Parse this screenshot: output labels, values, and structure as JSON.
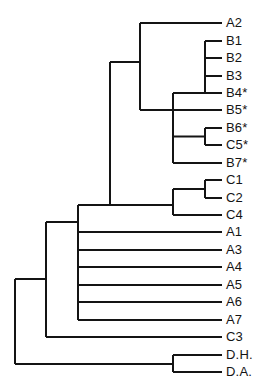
{
  "figure": {
    "kind": "dendrogram",
    "orientation": "horizontal-right-leaves",
    "background_color": "#ffffff",
    "line_color": "#141414",
    "label_color": "#141414",
    "line_width": 2,
    "width": 279,
    "height": 388
  },
  "chart_data": {
    "type": "tree",
    "title": "",
    "xlabel": "",
    "ylabel": "",
    "grid": false,
    "legend": null,
    "leaf_count": 21,
    "leaves": [
      {
        "id": "A2",
        "label": "A2",
        "y": 23,
        "branch_x": 140,
        "starred": false
      },
      {
        "id": "B1",
        "label": "B1",
        "y": 41,
        "branch_x": 205,
        "starred": false
      },
      {
        "id": "B2",
        "label": "B2",
        "y": 58,
        "branch_x": 205,
        "starred": false
      },
      {
        "id": "B3",
        "label": "B3",
        "y": 76,
        "branch_x": 205,
        "starred": false
      },
      {
        "id": "B4",
        "label": "B4*",
        "y": 93,
        "branch_x": 205,
        "starred": true
      },
      {
        "id": "B5",
        "label": "B5*",
        "y": 110,
        "branch_x": 173,
        "starred": true
      },
      {
        "id": "B6",
        "label": "B6*",
        "y": 128,
        "branch_x": 205,
        "starred": true
      },
      {
        "id": "C5",
        "label": "C5*",
        "y": 145,
        "branch_x": 205,
        "starred": true
      },
      {
        "id": "B7",
        "label": "B7*",
        "y": 163,
        "branch_x": 173,
        "starred": true
      },
      {
        "id": "C1",
        "label": "C1",
        "y": 180,
        "branch_x": 205,
        "starred": false
      },
      {
        "id": "C2",
        "label": "C2",
        "y": 198,
        "branch_x": 205,
        "starred": false
      },
      {
        "id": "C4",
        "label": "C4",
        "y": 215,
        "branch_x": 173,
        "starred": false
      },
      {
        "id": "A1",
        "label": "A1",
        "y": 232,
        "branch_x": 78,
        "starred": false
      },
      {
        "id": "A3",
        "label": "A3",
        "y": 250,
        "branch_x": 78,
        "starred": false
      },
      {
        "id": "A4",
        "label": "A4",
        "y": 267,
        "branch_x": 78,
        "starred": false
      },
      {
        "id": "A5",
        "label": "A5",
        "y": 285,
        "branch_x": 78,
        "starred": false
      },
      {
        "id": "A6",
        "label": "A6",
        "y": 302,
        "branch_x": 78,
        "starred": false
      },
      {
        "id": "A7",
        "label": "A7",
        "y": 320,
        "branch_x": 78,
        "starred": false
      },
      {
        "id": "C3",
        "label": "C3",
        "y": 337,
        "branch_x": 46,
        "starred": false
      },
      {
        "id": "D.H.",
        "label": "D.H.",
        "y": 355,
        "branch_x": 173,
        "starred": false
      },
      {
        "id": "D.A.",
        "label": "D.A.",
        "y": 372,
        "branch_x": 173,
        "starred": false
      }
    ],
    "leaf_tip_x": 222,
    "label_x": 226,
    "nodes": [
      {
        "id": "n-b6-c5",
        "x": 205,
        "y_top": 128,
        "y_bottom": 145,
        "parent_x": 173,
        "y": 136.5,
        "children": [
          "B6",
          "C5"
        ]
      },
      {
        "id": "n-b-upper",
        "x": 205,
        "y_top": 41,
        "y_bottom": 93,
        "parent_x": 173,
        "y": 93,
        "children": [
          "B1",
          "B2",
          "B3",
          "B4"
        ]
      },
      {
        "id": "n-b-all",
        "x": 173,
        "y_top": 93,
        "y_bottom": 163,
        "parent_x": 140,
        "y": 110,
        "children": [
          "n-b-upper",
          "B5",
          "n-b6-c5",
          "B7"
        ]
      },
      {
        "id": "n-c1-c2",
        "x": 205,
        "y_top": 180,
        "y_bottom": 198,
        "parent_x": 173,
        "y": 189
      },
      {
        "id": "n-c-cluster",
        "x": 173,
        "y_top": 189,
        "y_bottom": 215,
        "parent_x": 110,
        "y": 205,
        "children": [
          "n-c1-c2",
          "C4"
        ]
      },
      {
        "id": "n-a2-b",
        "x": 140,
        "y_top": 23,
        "y_bottom": 110,
        "parent_x": 110,
        "y": 62,
        "children": [
          "A2",
          "n-b-all"
        ]
      },
      {
        "id": "n-upper",
        "x": 110,
        "y_top": 62,
        "y_bottom": 205,
        "parent_x": 78,
        "y": 205,
        "children": [
          "n-a2-b",
          "n-c-cluster"
        ]
      },
      {
        "id": "n-a-group",
        "x": 78,
        "y_top": 205,
        "y_bottom": 320,
        "parent_x": 46,
        "y": 222,
        "children": [
          "n-upper",
          "A1",
          "A3",
          "A4",
          "A5",
          "A6",
          "A7"
        ]
      },
      {
        "id": "n-with-c3",
        "x": 46,
        "y_top": 222,
        "y_bottom": 337,
        "parent_x": 15,
        "y": 279,
        "children": [
          "n-a-group",
          "C3"
        ]
      },
      {
        "id": "n-d-pair",
        "x": 173,
        "y_top": 355,
        "y_bottom": 372,
        "parent_x": 15,
        "y": 364,
        "children": [
          "D.H.",
          "D.A."
        ]
      },
      {
        "id": "n-root",
        "x": 15,
        "y_top": 279,
        "y_bottom": 364,
        "parent_x": null,
        "y": 321,
        "children": [
          "n-with-c3",
          "n-d-pair"
        ]
      }
    ]
  }
}
